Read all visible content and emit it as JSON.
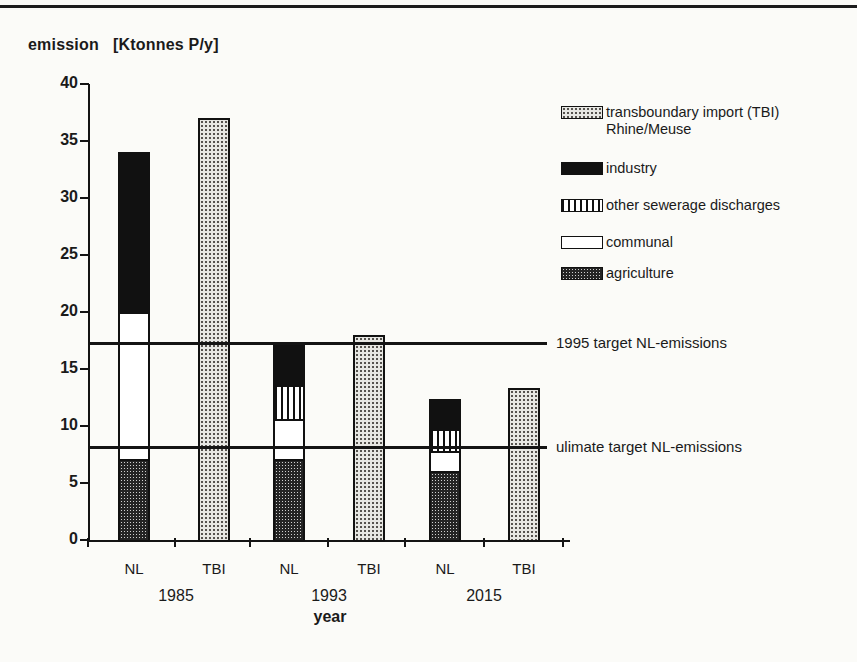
{
  "colors": {
    "ink": "#1a1a1a",
    "paper": "#fbfbf8",
    "light_stipple_bg": "#e7e7e3"
  },
  "axis_title": {
    "word": "emission",
    "units": "[Ktonnes P/y]"
  },
  "chart_data": {
    "type": "bar",
    "stacked": true,
    "xlabel": "year",
    "ylabel": "emission [Ktonnes P/y]",
    "ylim": [
      0,
      40
    ],
    "yticks": [
      0,
      5,
      10,
      15,
      20,
      25,
      30,
      35,
      40
    ],
    "categories": [
      "NL 1985",
      "TBI 1985",
      "NL 1993",
      "TBI 1993",
      "NL 2015",
      "TBI 2015"
    ],
    "bar_labels": [
      "NL",
      "TBI",
      "NL",
      "TBI",
      "NL",
      "TBI"
    ],
    "groups": [
      "1985",
      "1993",
      "2015"
    ],
    "series": [
      {
        "name": "agriculture",
        "pattern": "dark-stipple",
        "values": [
          7,
          0,
          7.2,
          0,
          6.2,
          0
        ]
      },
      {
        "name": "communal",
        "pattern": "white",
        "values": [
          13,
          0,
          3.5,
          0,
          1.7,
          0
        ]
      },
      {
        "name": "other sewerage discharges",
        "pattern": "vertical-stripes",
        "values": [
          0,
          0,
          2.9,
          0,
          1.9,
          0
        ]
      },
      {
        "name": "industry",
        "pattern": "solid-black",
        "values": [
          14,
          0,
          3.7,
          0,
          2.6,
          0
        ]
      },
      {
        "name": "transboundary import (TBI) Rhine/Meuse",
        "pattern": "light-stipple",
        "values": [
          0,
          37,
          0,
          18,
          0,
          13.3
        ]
      }
    ],
    "target_lines": [
      {
        "label": "1995 target NL-emissions",
        "value": 17.2
      },
      {
        "label": "ulimate target NL-emissions",
        "value": 8.1
      }
    ],
    "legend_position": "upper right",
    "grid": false
  },
  "legend": {
    "items": [
      {
        "label": "transboundary import (TBI)",
        "label2": "Rhine/Meuse",
        "pattern": "light-stipple"
      },
      {
        "label": "industry",
        "label2": "",
        "pattern": "solid-black"
      },
      {
        "label": "other sewerage discharges",
        "label2": "",
        "pattern": "vertical-stripes"
      },
      {
        "label": "communal",
        "label2": "",
        "pattern": "white"
      },
      {
        "label": "agriculture",
        "label2": "",
        "pattern": "dark-stipple"
      }
    ]
  },
  "x_axis": {
    "title": "year"
  }
}
